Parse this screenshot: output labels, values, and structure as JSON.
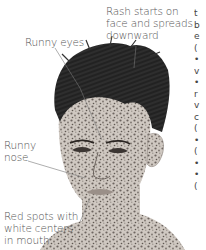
{
  "figure": {
    "labels": {
      "rash": [
        "Rash starts on",
        "face and spreads",
        "downward"
      ],
      "eyes": "Runny eyes",
      "nose": [
        "Runny",
        "nose"
      ],
      "mouth": [
        "Red spots with",
        "white centers",
        "in mouth"
      ]
    },
    "colors": {
      "label_text": "#555555",
      "leader_line": "#777777",
      "hair": "#1e1e1e",
      "skin": "#c9c2bb",
      "rash_spots": "#6d6560"
    }
  },
  "edge_text_fragments": [
    "t",
    "b",
    "e",
    "(",
    "•",
    "v",
    "•",
    "r",
    "v",
    "c",
    "(",
    "•",
    "(",
    "•",
    "•",
    "("
  ]
}
